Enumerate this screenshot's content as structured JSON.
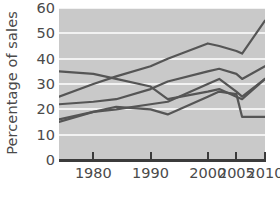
{
  "chart_data": {
    "type": "line",
    "title": "",
    "xlabel": "",
    "ylabel": "Percentage of sales",
    "xlim": [
      1974,
      2010
    ],
    "ylim": [
      0,
      60
    ],
    "grid": true,
    "legend": "none",
    "y_ticks": [
      0,
      10,
      20,
      30,
      40,
      50,
      60
    ],
    "y_tick_labels": [
      "0",
      "10",
      "20",
      "30",
      "40",
      "50",
      "60"
    ],
    "x_ticks": [
      1980,
      1990,
      2000,
      2005,
      2010
    ],
    "x_tick_labels": [
      "1980",
      "1990",
      "2000",
      "2005",
      "2010"
    ],
    "x": [
      1974,
      1980,
      1984,
      1990,
      1993,
      2000,
      2002,
      2005,
      2006,
      2010
    ],
    "series": [
      {
        "name": "series-1",
        "color": "#555555",
        "values": [
          25,
          30,
          33,
          37,
          40,
          46,
          45,
          43,
          42,
          55
        ]
      },
      {
        "name": "series-2",
        "color": "#555555",
        "values": [
          22,
          23,
          24,
          28,
          31,
          35,
          36,
          34,
          32,
          37
        ]
      },
      {
        "name": "series-3",
        "color": "#555555",
        "values": [
          16,
          19,
          20,
          22,
          23,
          30,
          32,
          27,
          25,
          32
        ]
      },
      {
        "name": "series-4",
        "color": "#555555",
        "values": [
          15,
          19,
          21,
          20,
          18,
          25,
          27,
          26,
          17,
          17
        ]
      },
      {
        "name": "series-5",
        "color": "#555555",
        "values": [
          35,
          34,
          32,
          29,
          24,
          27,
          28,
          25,
          24,
          32
        ]
      }
    ]
  },
  "axes": {
    "ylabel": "Percentage of sales",
    "y_tick_labels": [
      "60",
      "50",
      "40",
      "30",
      "20",
      "10",
      "0"
    ],
    "x_tick_labels": [
      "1980",
      "1990",
      "2000",
      "2005",
      "2010"
    ]
  },
  "colors": {
    "plot_background": "#c9c9c9",
    "gridline": "#f2f2f2",
    "axis": "#3b3b3b",
    "text": "#4a4a4a",
    "line": "#555555"
  }
}
